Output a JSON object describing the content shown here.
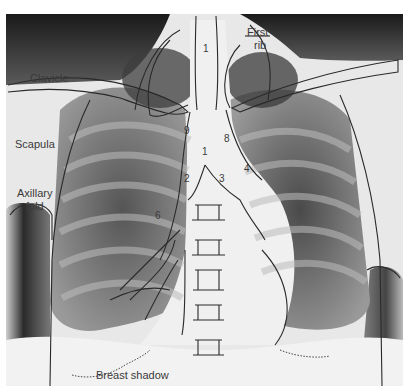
{
  "figure": {
    "labels": {
      "clavicle": "Clavicle",
      "first_rib_line1": "First",
      "first_rib_line2": "rib",
      "scapula": "Scapula",
      "axillary_line1": "Axillary",
      "axillary_line2": "fold",
      "breast_shadow": "Breast shadow"
    },
    "numbers": {
      "n1_top": "1",
      "n1_mid": "1",
      "n2": "2",
      "n3": "3",
      "n4": "4",
      "n6": "6",
      "n8": "8",
      "n9": "9"
    }
  }
}
